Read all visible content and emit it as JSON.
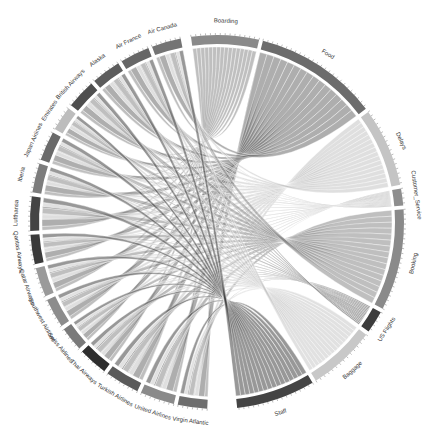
{
  "chart_data": {
    "type": "chord",
    "title": "",
    "center": [
      217,
      222
    ],
    "outer_radius": 187,
    "inner_radius": 178,
    "groups_left": [
      {
        "name": "Virgin Atlantic",
        "value": 6,
        "color": "#6e6e6e"
      },
      {
        "name": "United Airlines",
        "value": 7,
        "color": "#8a8a8a"
      },
      {
        "name": "Turkish Airlines",
        "value": 7,
        "color": "#5a5a5a"
      },
      {
        "name": "Thai Airways",
        "value": 6,
        "color": "#2e2e2e"
      },
      {
        "name": "Swiss Airlines",
        "value": 5,
        "color": "#7a7a7a"
      },
      {
        "name": "Southwest Airlines",
        "value": 6,
        "color": "#8c8c8c"
      },
      {
        "name": "Qatar Airways",
        "value": 6,
        "color": "#9a9a9a"
      },
      {
        "name": "Qantas Airways",
        "value": 6,
        "color": "#3a3a3a"
      },
      {
        "name": "Lufthansa",
        "value": 7,
        "color": "#444444"
      },
      {
        "name": "Iberia",
        "value": 6,
        "color": "#7c7c7c"
      },
      {
        "name": "Japan Airlines",
        "value": 6,
        "color": "#6a6a6a"
      },
      {
        "name": "Emirates",
        "value": 5,
        "color": "#bdbdbd"
      },
      {
        "name": "British Airways",
        "value": 6,
        "color": "#4e4e4e"
      },
      {
        "name": "Alaska",
        "value": 6,
        "color": "#5c5c5c"
      },
      {
        "name": "Air France",
        "value": 6,
        "color": "#666666"
      },
      {
        "name": "Air Canada",
        "value": 6,
        "color": "#747474"
      }
    ],
    "groups_right": [
      {
        "name": "Boarding",
        "value": 12,
        "color": "#8a8a8a"
      },
      {
        "name": "Food",
        "value": 22,
        "color": "#6c6c6c"
      },
      {
        "name": "Delays",
        "value": 14,
        "color": "#c4c4c4"
      },
      {
        "name": "Customer_Service",
        "value": 3,
        "color": "#8e8e8e"
      },
      {
        "name": "Booking",
        "value": 18,
        "color": "#8a8a8a"
      },
      {
        "name": "US Flights",
        "value": 4,
        "color": "#3c3c3c"
      },
      {
        "name": "Baggage",
        "value": 12,
        "color": "#c8c8c8"
      },
      {
        "name": "Staff",
        "value": 14,
        "color": "#444444"
      }
    ],
    "angles_deg": {
      "right_start": -8,
      "right_end": 175,
      "left_start": 183,
      "left_end": 350
    }
  }
}
